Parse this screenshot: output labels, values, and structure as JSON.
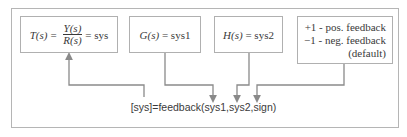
{
  "boxes": {
    "closed_loop": {
      "lhs": "T(s)",
      "eq": "=",
      "numerator": "Y(s)",
      "denominator": "R(s)",
      "rhs": "= sys"
    },
    "plant": {
      "label_fn": "G(s)",
      "label_rhs": "= sys1"
    },
    "feedback": {
      "label_fn": "H(s)",
      "label_rhs": "= sys2"
    },
    "sign": {
      "line1": "+1 - pos. feedback",
      "line2": "−1 - neg. feedback",
      "line3": "(default)"
    }
  },
  "command": "[sys]=feedback(sys1,sys2,sign)",
  "colors": {
    "line": "#8a8a8a",
    "border": "#b0b0b0",
    "text": "#3a3a3a"
  }
}
